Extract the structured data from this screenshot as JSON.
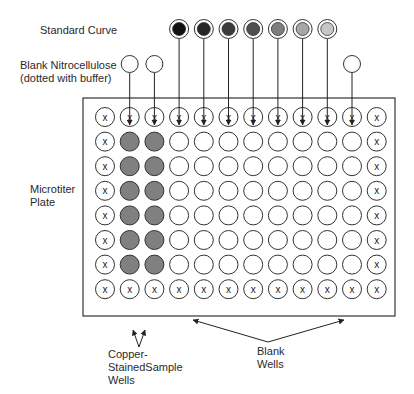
{
  "labels": {
    "standard_curve": "Standard Curve",
    "blank_nitro_line1": "Blank Nitrocellulose",
    "blank_nitro_line2": "(dotted with buffer)",
    "plate_line1": "Microtiter",
    "plate_line2": "Plate",
    "copper_line1": "Copper-",
    "copper_line2": "StainedSample",
    "copper_line3": "Wells",
    "blank_wells_line1": "Blank",
    "blank_wells_line2": "Wells"
  },
  "plate": {
    "rows": 8,
    "cols": 12,
    "edge_marker": "x",
    "copper_columns": [
      2,
      3
    ],
    "copper_fill": "#808080",
    "blank_fill": "#ffffff"
  },
  "standard_curve": {
    "target_columns": [
      4,
      5,
      6,
      7,
      8,
      9,
      10
    ],
    "colors": [
      "#111111",
      "#262626",
      "#3b3b3b",
      "#505050",
      "#7e7e7e",
      "#a6a6a6",
      "#c6c6c6"
    ]
  },
  "blank_nitrocellulose": {
    "target_columns": [
      2,
      3,
      11
    ]
  }
}
